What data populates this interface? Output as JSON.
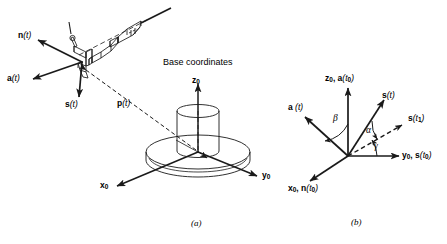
{
  "figure": {
    "stroke_color": "#1a1a1a",
    "background_color": "#ffffff",
    "panels": [
      {
        "id": "a",
        "caption": "(a)",
        "description": "Robot gripper with hand coordinate vectors n(t), s(t), a(t) and position vector p(t) relative to base coordinates",
        "heading": "Base coordinates",
        "vectors": [
          {
            "name": "n-vector",
            "label": "n",
            "arg": "(t)",
            "direction": "up-left"
          },
          {
            "name": "s-vector",
            "label": "s",
            "arg": "(t)",
            "direction": "down"
          },
          {
            "name": "a-vector",
            "label": "a",
            "arg": "(t)",
            "direction": "down-left"
          },
          {
            "name": "p-vector",
            "label": "p",
            "arg": "(t)",
            "direction": "diagonal-dashed-double"
          }
        ],
        "base_axes": [
          {
            "name": "z0-axis",
            "label": "z",
            "sub": "0",
            "direction": "up"
          },
          {
            "name": "y0-axis",
            "label": "y",
            "sub": "0",
            "direction": "down-right"
          },
          {
            "name": "x0-axis",
            "label": "x",
            "sub": "0",
            "direction": "down-left"
          }
        ]
      },
      {
        "id": "b",
        "caption": "(b)",
        "description": "Euler angle representation showing rotation angles alpha, beta, gamma between base axes and hand axes",
        "axes": [
          {
            "name": "z0-a-t0-axis",
            "label": "z",
            "sub": "0",
            "second": "a",
            "second_arg": "(t",
            "second_sub": "0",
            "second_close": ")",
            "text": "z0, a(t0)",
            "direction": "up"
          },
          {
            "name": "y0-s-t0-axis",
            "label": "y",
            "sub": "0",
            "second": "s",
            "text": "y0, s(t0)",
            "direction": "right"
          },
          {
            "name": "x0-n-t0-axis",
            "label": "x",
            "sub": "0",
            "second": "n",
            "text": "x0, n(t0)",
            "direction": "down-left"
          },
          {
            "name": "a-t-axis",
            "label": "a",
            "arg": "(t)",
            "text": "a(t)",
            "direction": "up-left"
          },
          {
            "name": "s-t-axis",
            "label": "s",
            "arg": "(t)",
            "text": "s(t)",
            "direction": "up-right"
          },
          {
            "name": "s-t1-axis",
            "label": "s",
            "arg": "(t",
            "sub": "1",
            "close": ")",
            "text": "s(t1)",
            "direction": "right-up-dashed"
          }
        ],
        "angles": [
          {
            "name": "beta-angle",
            "symbol": "β",
            "between": "z0 and a(t)"
          },
          {
            "name": "alpha-angle",
            "symbol": "α",
            "between": "s(t) and s(t1)"
          },
          {
            "name": "gamma-angle",
            "symbol": "γ",
            "between": "y0 and s(t1)"
          }
        ]
      }
    ]
  }
}
